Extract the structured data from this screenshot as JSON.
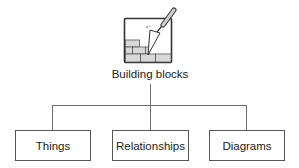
{
  "diagram": {
    "type": "hierarchy",
    "root": {
      "label": "Building blocks",
      "icon": "brick-wall-trowel-icon"
    },
    "children": [
      {
        "label": "Things"
      },
      {
        "label": "Relationships"
      },
      {
        "label": "Diagrams"
      }
    ],
    "colors": {
      "lines": "#6e6e6e",
      "box_border": "#555555",
      "text": "#222222",
      "background": "#ffffff"
    }
  }
}
